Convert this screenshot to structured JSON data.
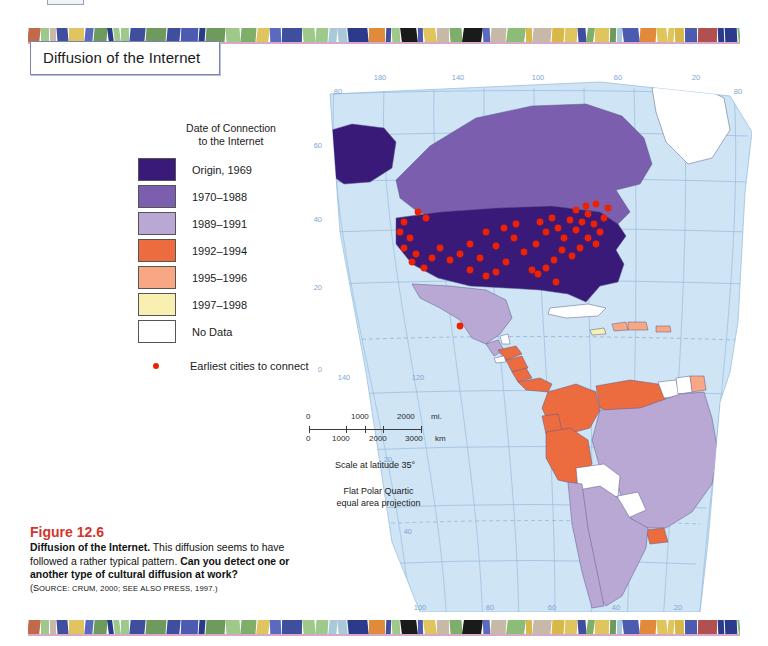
{
  "figure": {
    "title": "Diffusion of the Internet",
    "number": "Figure 12.6",
    "caption_bold_lead": "Diffusion of the Internet.",
    "caption_text": " This diffusion seems to have followed a rather typical pattern. ",
    "caption_bold_question": "Can you detect one or another type of cultural diffusion at work?",
    "source_open": "(S",
    "source": "ource: Crum, 2000; see also Press, 1997.)"
  },
  "legend": {
    "title_line1": "Date of Connection",
    "title_line2": "to the Internet",
    "items": [
      {
        "label": "Origin, 1969",
        "color": "#3a1a78"
      },
      {
        "label": "1970–1988",
        "color": "#7b5fae"
      },
      {
        "label": "1989–1991",
        "color": "#b9a8d4"
      },
      {
        "label": "1992–1994",
        "color": "#ec6b3f"
      },
      {
        "label": "1995–1996",
        "color": "#f7a783"
      },
      {
        "label": "1997–1998",
        "color": "#f8efb0"
      },
      {
        "label": "No Data",
        "color": "#ffffff"
      }
    ],
    "dot_label": "Earliest cities to connect",
    "dot_color": "#ee2200"
  },
  "scale": {
    "miles_labels": [
      "0",
      "1000",
      "2000",
      "mi."
    ],
    "km_labels": [
      "0",
      "1000",
      "2000",
      "3000",
      "km"
    ],
    "note": "Scale at latitude 35°",
    "projection_line1": "Flat Polar Quartic",
    "projection_line2": "equal area projection"
  },
  "graticule": {
    "top_longitudes": [
      "180",
      "140",
      "100",
      "60",
      "20"
    ],
    "top_corner_left": "80",
    "top_corner_right": "80",
    "bottom_longitudes": [
      "100",
      "80",
      "60",
      "40",
      "20"
    ],
    "inset_longitudes": [
      "140",
      "120"
    ],
    "left_latitudes": [
      "60",
      "40",
      "20",
      "0"
    ],
    "right_latitudes": [
      "20",
      "40"
    ],
    "grid_color": "#8fb6da",
    "ocean_color": "#cfe4f5"
  },
  "chart_data": {
    "type": "map",
    "title": "Diffusion of the Internet",
    "projection": "Flat Polar Quartic equal area projection",
    "regions": [
      {
        "name": "United States",
        "category": "Origin, 1969"
      },
      {
        "name": "Alaska",
        "category": "Origin, 1969"
      },
      {
        "name": "Canada",
        "category": "1970–1988"
      },
      {
        "name": "Mexico",
        "category": "1989–1991"
      },
      {
        "name": "Greenland",
        "category": "No Data"
      },
      {
        "name": "Guatemala",
        "category": "1989–1991"
      },
      {
        "name": "Belize",
        "category": "No Data"
      },
      {
        "name": "Honduras",
        "category": "1992–1994"
      },
      {
        "name": "El Salvador",
        "category": "No Data"
      },
      {
        "name": "Nicaragua",
        "category": "1992–1994"
      },
      {
        "name": "Costa Rica",
        "category": "1992–1994"
      },
      {
        "name": "Panama",
        "category": "1992–1994"
      },
      {
        "name": "Cuba",
        "category": "No Data"
      },
      {
        "name": "Jamaica",
        "category": "1997–1998"
      },
      {
        "name": "Haiti",
        "category": "1995–1996"
      },
      {
        "name": "Dominican Republic",
        "category": "1995–1996"
      },
      {
        "name": "Puerto Rico",
        "category": "1995–1996"
      },
      {
        "name": "Colombia",
        "category": "1992–1994"
      },
      {
        "name": "Venezuela",
        "category": "1992–1994"
      },
      {
        "name": "Ecuador",
        "category": "1992–1994"
      },
      {
        "name": "Peru",
        "category": "1992–1994"
      },
      {
        "name": "Guyana",
        "category": "No Data"
      },
      {
        "name": "Suriname",
        "category": "No Data"
      },
      {
        "name": "French Guiana",
        "category": "1995–1996"
      },
      {
        "name": "Brazil",
        "category": "1989–1991"
      },
      {
        "name": "Bolivia",
        "category": "No Data"
      },
      {
        "name": "Paraguay",
        "category": "No Data"
      },
      {
        "name": "Uruguay",
        "category": "1992–1994"
      },
      {
        "name": "Argentina",
        "category": "1989–1991"
      },
      {
        "name": "Chile",
        "category": "1989–1991"
      }
    ],
    "point_series": {
      "name": "Earliest cities to connect",
      "marker_color": "#ee2200",
      "count": 47
    },
    "legend_categories": [
      "Origin, 1969",
      "1970–1988",
      "1989–1991",
      "1992–1994",
      "1995–1996",
      "1997–1998",
      "No Data"
    ]
  }
}
